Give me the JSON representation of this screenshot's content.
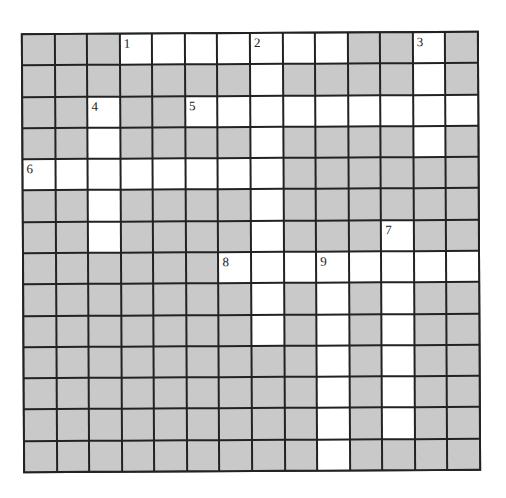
{
  "puzzle": {
    "rows": 14,
    "cols": 14,
    "colors": {
      "block": "#c9c9c9",
      "open": "#ffffff",
      "line": "#222222"
    },
    "grid": [
      "GGGWWWWWWWGGWG",
      "GGGGGGGWGGGGWG",
      "GGWGGWWWWWWWWW",
      "GGWGGGGWGGGGWG",
      "WWWWWWWWGGGGGG",
      "GGWGGGGWGGGGGG",
      "GGWGGGGWGGGWGG",
      "GGGGGGWWWWWWWW",
      "GGGGGGGWGWGWGG",
      "GGGGGGGWGWGWGG",
      "GGGGGGGGGWGWGG",
      "GGGGGGGGGWGWGG",
      "GGGGGGGGGWGWGG",
      "GGGGGGGGGWGGGG"
    ],
    "numbers": [
      {
        "row": 0,
        "col": 3,
        "n": "1"
      },
      {
        "row": 0,
        "col": 7,
        "n": "2"
      },
      {
        "row": 0,
        "col": 12,
        "n": "3"
      },
      {
        "row": 2,
        "col": 2,
        "n": "4"
      },
      {
        "row": 2,
        "col": 5,
        "n": "5"
      },
      {
        "row": 4,
        "col": 0,
        "n": "6"
      },
      {
        "row": 6,
        "col": 11,
        "n": "7"
      },
      {
        "row": 7,
        "col": 6,
        "n": "8"
      },
      {
        "row": 7,
        "col": 9,
        "n": "9"
      }
    ]
  }
}
